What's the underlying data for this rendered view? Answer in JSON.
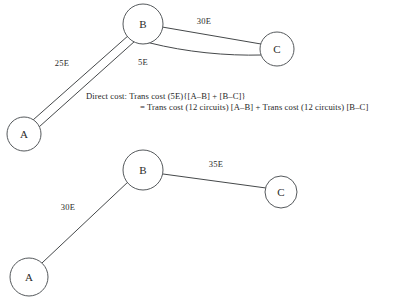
{
  "figure": {
    "background_color": "#ffffff",
    "stroke_color": "#45484a",
    "text_color": "#1f1f1f"
  },
  "diagrams": [
    {
      "id": "direct-routing-diagram",
      "name": "top-diagram",
      "edge_style": "double-line",
      "nodes": [
        {
          "id": "A",
          "label": "A",
          "cx": 24,
          "cy": 134,
          "r": 17
        },
        {
          "id": "B",
          "label": "B",
          "cx": 143,
          "cy": 24,
          "r": 20
        },
        {
          "id": "C",
          "label": "C",
          "cx": 277,
          "cy": 49,
          "r": 17
        }
      ],
      "edges": [
        {
          "id": "A-B",
          "from": "A",
          "to": "B",
          "label": "25E",
          "label_x": 62,
          "label_y": 63
        },
        {
          "id": "B-C",
          "from": "B",
          "to": "C",
          "label": "30E",
          "label_x": 204,
          "label_y": 21
        },
        {
          "id": "B-C-lower-label",
          "from": "B",
          "to": "C",
          "label": "5E",
          "label_x": 143,
          "label_y": 62
        }
      ]
    },
    {
      "id": "aggregate-routing-diagram",
      "name": "bottom-diagram",
      "edge_style": "single-line",
      "nodes": [
        {
          "id": "A2",
          "label": "A",
          "cx": 29,
          "cy": 277,
          "r": 19
        },
        {
          "id": "B2",
          "label": "B",
          "cx": 143,
          "cy": 170,
          "r": 20
        },
        {
          "id": "C2",
          "label": "C",
          "cx": 281,
          "cy": 192,
          "r": 16
        }
      ],
      "edges": [
        {
          "id": "A2-B2",
          "from": "A2",
          "to": "B2",
          "label": "30E",
          "label_x": 68,
          "label_y": 207
        },
        {
          "id": "B2-C2",
          "from": "B2",
          "to": "C2",
          "label": "35E",
          "label_x": 216,
          "label_y": 164
        }
      ]
    }
  ],
  "annotation": {
    "id": "direct-cost-formula",
    "line1": "Direct cost: Trans cost (5E){[A–B] + [B–C]}",
    "line2": "= Trans cost (12 circuits) [A–B] + Trans cost (12 circuits) [B–C]"
  }
}
